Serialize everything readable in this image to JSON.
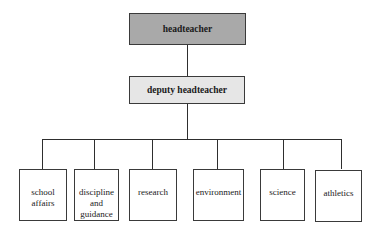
{
  "diagram": {
    "type": "org-chart",
    "root": {
      "label": "headteacher",
      "fill": "#a9a9a9"
    },
    "deputy": {
      "label": "deputy headteacher",
      "fill": "#e6e6e6"
    },
    "departments": [
      {
        "label": "school affairs"
      },
      {
        "label": "discipline and guidance"
      },
      {
        "label": "research"
      },
      {
        "label": "environment"
      },
      {
        "label": "science"
      },
      {
        "label": "athletics"
      }
    ],
    "edges": [
      [
        "headteacher",
        "deputy headteacher"
      ],
      [
        "deputy headteacher",
        "school affairs"
      ],
      [
        "deputy headteacher",
        "discipline and guidance"
      ],
      [
        "deputy headteacher",
        "research"
      ],
      [
        "deputy headteacher",
        "environment"
      ],
      [
        "deputy headteacher",
        "science"
      ],
      [
        "deputy headteacher",
        "athletics"
      ]
    ],
    "colors": {
      "line": "#2e2e2e",
      "border": "#3a3a3a",
      "child_fill": "#ffffff"
    }
  }
}
